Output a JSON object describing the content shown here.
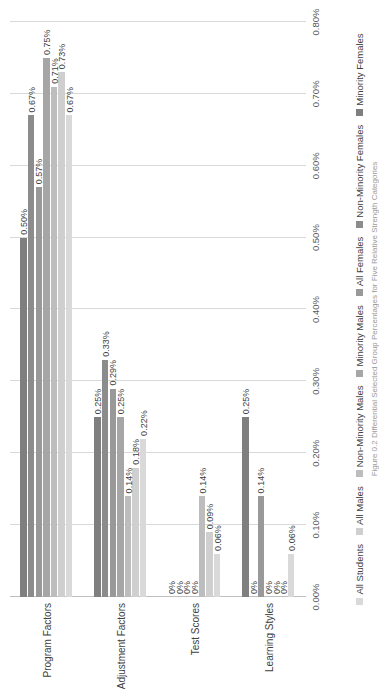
{
  "chart_data": {
    "type": "bar",
    "orientation": "horizontal",
    "title": "",
    "xlabel": "",
    "ylabel": "",
    "categories": [
      "Program Factors",
      "Adjustment Factors",
      "Test Scores",
      "Learning Styles"
    ],
    "series": [
      {
        "name": "All Students",
        "color": "#d9d9d9",
        "values": [
          0.67,
          0.22,
          0.06,
          0.06
        ],
        "labels": [
          "0.67%",
          "0.22%",
          "0.06%",
          "0.06%"
        ]
      },
      {
        "name": "All Males",
        "color": "#cfcfcf",
        "values": [
          0.73,
          0.18,
          0.09,
          0.0
        ],
        "labels": [
          "0.73%",
          "0.18%",
          "0.09%",
          "0%"
        ]
      },
      {
        "name": "Non-Minority Males",
        "color": "#bdbdbd",
        "values": [
          0.71,
          0.14,
          0.14,
          0.0
        ],
        "labels": [
          "0.71%",
          "0.14%",
          "0.14%",
          "0%"
        ]
      },
      {
        "name": "Minority Males",
        "color": "#a6a6a6",
        "values": [
          0.75,
          0.25,
          0.0,
          0.0
        ],
        "labels": [
          "0.75%",
          "0.25%",
          "0%",
          "0%"
        ]
      },
      {
        "name": "All Females",
        "color": "#999999",
        "values": [
          0.57,
          0.29,
          0.0,
          0.14
        ],
        "labels": [
          "0.57%",
          "0.29%",
          "0%",
          "0.14%"
        ]
      },
      {
        "name": "Non-Minority Females",
        "color": "#8c8c8c",
        "values": [
          0.67,
          0.33,
          0.0,
          0.0
        ],
        "labels": [
          "0.67%",
          "0.33%",
          "0%",
          "0%"
        ]
      },
      {
        "name": "Minority Females",
        "color": "#7f7f7f",
        "values": [
          0.5,
          0.25,
          0.0,
          0.25
        ],
        "labels": [
          "0.50%",
          "0.25%",
          "0%",
          "0.25%"
        ]
      }
    ],
    "xlim": [
      0,
      0.8
    ],
    "tick_labels": [
      "0.00%",
      "0.10%",
      "0.20%",
      "0.30%",
      "0.40%",
      "0.50%",
      "0.60%",
      "0.70%",
      "0.80%"
    ],
    "tick_values": [
      0,
      0.1,
      0.2,
      0.3,
      0.4,
      0.5,
      0.6,
      0.7,
      0.8
    ],
    "grid": true,
    "legend_position": "bottom",
    "rotation_deg": -90
  },
  "caption": {
    "text": "Figure 0.2 Differential Selected Group Percentages for Five Relative Strength Categories"
  }
}
